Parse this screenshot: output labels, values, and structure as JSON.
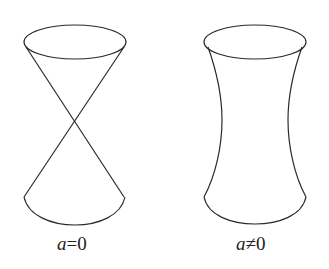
{
  "figures": [
    {
      "id": "cone",
      "shape": "double-cone",
      "label_var": "a",
      "label_rel": "=0",
      "label": "a=0"
    },
    {
      "id": "hyperboloid",
      "shape": "hyperboloid-of-one-sheet",
      "label_var": "a",
      "label_rel": "≠0",
      "label": "a≠0"
    }
  ],
  "colors": {
    "stroke": "#2a2a2a",
    "background": "#ffffff"
  }
}
